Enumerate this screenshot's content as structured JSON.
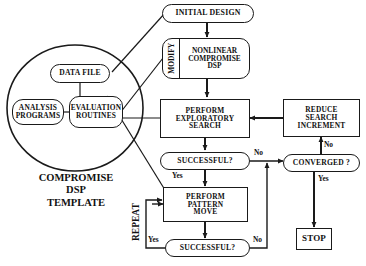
{
  "diagram": {
    "stroke_color": "#1a1a1a",
    "text_color": "#111111",
    "background": "#ffffff"
  },
  "template_group": {
    "caption_line1": "COMPROMISE",
    "caption_line2": "DSP",
    "caption_line3": "TEMPLATE",
    "nodes": {
      "data_file": "DATA FILE",
      "analysis_programs_line1": "ANALYSIS",
      "analysis_programs_line2": "PROGRAMS",
      "evaluation_routines_line1": "EVALUATION",
      "evaluation_routines_line2": "ROUTINES"
    }
  },
  "flow": {
    "initial_design": "INITIAL DESIGN",
    "modify": "MODIFY",
    "nonlinear_line1": "NONLINEAR",
    "nonlinear_line2": "COMPROMISE",
    "nonlinear_line3": "DSP",
    "exploratory_line1": "PERFORM",
    "exploratory_line2": "EXPLORATORY",
    "exploratory_line3": "SEARCH",
    "reduce_line1": "REDUCE",
    "reduce_line2": "SEARCH",
    "reduce_line3": "INCREMENT",
    "successful_1": "SUCCESSFUL?",
    "converged": "CONVERGED ?",
    "pattern_line1": "PERFORM",
    "pattern_line2": "PATTERN",
    "pattern_line3": "MOVE",
    "successful_2": "SUCCESSFUL?",
    "stop": "STOP",
    "repeat": "REPEAT"
  },
  "edge_labels": {
    "no_after_successful1": "No",
    "yes_after_successful1": "Yes",
    "no_above_converged": "No",
    "yes_below_converged": "Yes",
    "yes_after_successful2": "Yes",
    "no_after_successful2": "No"
  }
}
